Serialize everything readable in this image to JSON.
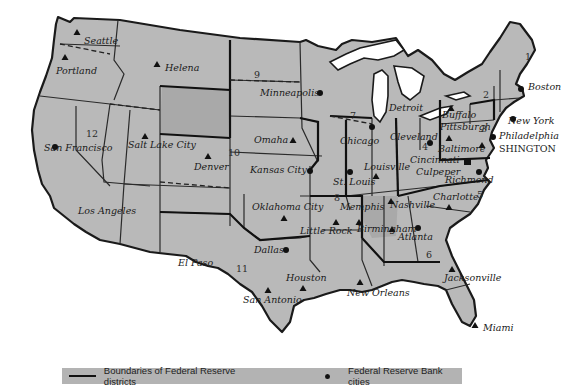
{
  "map": {
    "title": "Federal Reserve districts",
    "districts": [
      {
        "number": "1",
        "label_pos": [
          528,
          58
        ]
      },
      {
        "number": "2",
        "label_pos": [
          485,
          96
        ]
      },
      {
        "number": "3",
        "label_pos": [
          483,
          129
        ]
      },
      {
        "number": "4",
        "label_pos": [
          424,
          147
        ]
      },
      {
        "number": "5",
        "label_pos": [
          477,
          197
        ]
      },
      {
        "number": "6",
        "label_pos": [
          428,
          256
        ]
      },
      {
        "number": "7",
        "label_pos": [
          351,
          117
        ]
      },
      {
        "number": "8",
        "label_pos": [
          336,
          199
        ]
      },
      {
        "number": "9",
        "label_pos": [
          257,
          76
        ]
      },
      {
        "number": "10",
        "label_pos": [
          236,
          154
        ]
      },
      {
        "number": "11",
        "label_pos": [
          240,
          270
        ]
      },
      {
        "number": "12",
        "label_pos": [
          91,
          135
        ]
      }
    ],
    "reserve_bank_cities": [
      {
        "name": "Boston",
        "x": 521,
        "y": 89
      },
      {
        "name": "New York",
        "x": 513,
        "y": 119
      },
      {
        "name": "Philadelphia",
        "x": 493,
        "y": 137
      },
      {
        "name": "Cleveland",
        "x": 430,
        "y": 143
      },
      {
        "name": "Richmond",
        "x": 479,
        "y": 172
      },
      {
        "name": "Atlanta",
        "x": 418,
        "y": 228
      },
      {
        "name": "Chicago",
        "x": 372,
        "y": 127
      },
      {
        "name": "St. Louis",
        "x": 350,
        "y": 172
      },
      {
        "name": "Minneapolis",
        "x": 320,
        "y": 93
      },
      {
        "name": "Kansas City",
        "x": 310,
        "y": 171
      },
      {
        "name": "Dallas",
        "x": 286,
        "y": 250
      },
      {
        "name": "San Francisco",
        "x": 55,
        "y": 147
      }
    ],
    "branch_cities": [
      {
        "name": "Seattle",
        "x": 77,
        "y": 33
      },
      {
        "name": "Portland",
        "x": 65,
        "y": 57
      },
      {
        "name": "Helena",
        "x": 157,
        "y": 64
      },
      {
        "name": "Salt Lake City",
        "x": 145,
        "y": 136
      },
      {
        "name": "Denver",
        "x": 208,
        "y": 156
      },
      {
        "name": "Omaha",
        "x": 293,
        "y": 140
      },
      {
        "name": "Oklahoma City",
        "x": 284,
        "y": 218
      },
      {
        "name": "Little Rock",
        "x": 336,
        "y": 222
      },
      {
        "name": "Memphis",
        "x": 359,
        "y": 222
      },
      {
        "name": "Louisville",
        "x": 376,
        "y": 176
      },
      {
        "name": "Nashville",
        "x": 391,
        "y": 201
      },
      {
        "name": "Birmingham",
        "x": 392,
        "y": 229
      },
      {
        "name": "Cincinnati",
        "x": 410,
        "y": 164
      },
      {
        "name": "Pittsburgh",
        "x": 449,
        "y": 138
      },
      {
        "name": "Buffalo",
        "x": 451,
        "y": 108
      },
      {
        "name": "Detroit",
        "x": 414,
        "y": 120
      },
      {
        "name": "Baltimore",
        "x": 482,
        "y": 145
      },
      {
        "name": "Charlotte",
        "x": 449,
        "y": 207
      },
      {
        "name": "Jacksonville",
        "x": 452,
        "y": 269
      },
      {
        "name": "Miami",
        "x": 475,
        "y": 325
      },
      {
        "name": "New Orleans",
        "x": 360,
        "y": 282
      },
      {
        "name": "Houston",
        "x": 303,
        "y": 288
      },
      {
        "name": "San Antonio",
        "x": 268,
        "y": 290
      },
      {
        "name": "El Paso",
        "x": 186,
        "y": 257
      },
      {
        "name": "Los Angeles",
        "x": 70,
        "y": 210
      }
    ],
    "board_of_governors": {
      "name": "WASHINGTON",
      "visible_text": "SHINGTON",
      "x": 475,
      "y": 160
    }
  },
  "labels": {
    "seattle": "Seattle",
    "portland": "Portland",
    "helena": "Helena",
    "san_francisco": "San Francisco",
    "salt_lake_city": "Salt Lake City",
    "los_angeles": "Los Angeles",
    "denver": "Denver",
    "minneapolis": "Minneapolis",
    "omaha": "Omaha",
    "kansas_city": "Kansas City",
    "oklahoma_city": "Oklahoma City",
    "dallas": "Dallas",
    "el_paso": "El Paso",
    "san_antonio": "San Antonio",
    "houston": "Houston",
    "new_orleans": "New Orleans",
    "little_rock": "Little Rock",
    "memphis": "Memphis",
    "st_louis": "St. Louis",
    "louisville": "Louisville",
    "chicago": "Chicago",
    "detroit": "Detroit",
    "cleveland": "Cleveland",
    "cincinnati": "Cincinnati",
    "nashville": "Nashville",
    "birmingham": "Birmingham",
    "atlanta": "Atlanta",
    "jacksonville": "Jacksonville",
    "miami": "Miami",
    "charlotte": "Charlotte",
    "richmond": "Richmond",
    "culpeper": "Culpeper",
    "baltimore": "Baltimore",
    "pittsburgh": "Pittsburgh",
    "buffalo": "Buffalo",
    "philadelphia": "Philadelphia",
    "new_york": "New York",
    "washington": "SHINGTON",
    "boston": "Boston",
    "d1": "1",
    "d2": "2",
    "d3": "3",
    "d4": "4",
    "d5": "5",
    "d6": "6",
    "d7": "7",
    "d8": "8",
    "d9": "9",
    "d10": "10",
    "d11": "11",
    "d12": "12"
  },
  "legend": {
    "boundaries_label": "Boundaries of Federal Reserve districts",
    "cities_label": "Federal Reserve Bank cities"
  },
  "colors": {
    "land": "#b9b9b9",
    "boundary": "#111111",
    "legend_bg": "#b3b3b3",
    "background": "#ffffff"
  }
}
